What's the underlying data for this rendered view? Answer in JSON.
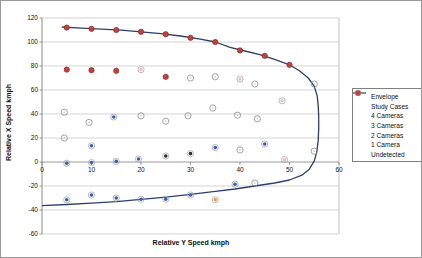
{
  "chart_data": {
    "type": "scatter",
    "title": "",
    "xlabel": "Relative Y Speed kmph",
    "ylabel": "Relative X Speed kmph",
    "xlim": [
      0,
      60
    ],
    "ylim": [
      -60,
      120
    ],
    "x_ticks": [
      0,
      10,
      20,
      30,
      40,
      50,
      60
    ],
    "y_ticks": [
      -60,
      -40,
      -20,
      0,
      20,
      40,
      60,
      80,
      100,
      120
    ],
    "grid": "horizontal",
    "legend_position": "right",
    "style": {
      "grid_color": "#c9c9c9",
      "axis_color": "#7f7f7f",
      "plot_border_color": "#b4b4b4",
      "text_color": "#111111",
      "background": "#ffffff",
      "halo_color": "#a8a8a8"
    },
    "envelope": {
      "name": "Envelope",
      "color": "#2c3f6e",
      "points": [
        [
          4,
          112.5
        ],
        [
          8,
          111.5
        ],
        [
          12,
          110.7
        ],
        [
          16,
          109.8
        ],
        [
          20,
          108.5
        ],
        [
          24,
          107
        ],
        [
          28,
          105
        ],
        [
          32,
          102.3
        ],
        [
          35,
          100
        ],
        [
          38,
          95.5
        ],
        [
          41,
          92.5
        ],
        [
          44,
          89.5
        ],
        [
          47,
          85.5
        ],
        [
          50,
          81
        ],
        [
          52,
          76
        ],
        [
          53.8,
          70
        ],
        [
          55,
          63
        ],
        [
          55.6,
          55
        ],
        [
          55.8,
          47
        ],
        [
          55.9,
          38
        ],
        [
          55.9,
          28
        ],
        [
          55.8,
          18
        ],
        [
          55.5,
          8
        ],
        [
          55,
          1
        ],
        [
          54,
          -6
        ],
        [
          52.5,
          -11
        ],
        [
          50,
          -15
        ],
        [
          47,
          -17.5
        ],
        [
          43,
          -20
        ],
        [
          39,
          -22.5
        ],
        [
          35,
          -24.5
        ],
        [
          30,
          -27
        ],
        [
          25,
          -29.3
        ],
        [
          20,
          -31.2
        ],
        [
          15,
          -33
        ],
        [
          10,
          -34.3
        ],
        [
          5,
          -35.4
        ],
        [
          0,
          -36.3
        ]
      ]
    },
    "series": [
      {
        "name": "Study Cases",
        "marker": "open",
        "color": "#8c8c8c",
        "dot_color": "#c2c2c2",
        "points": [
          [
            30,
            70
          ],
          [
            35,
            71
          ],
          [
            43,
            65
          ],
          [
            55,
            65
          ],
          [
            4.5,
            41.5
          ],
          [
            9.5,
            33
          ],
          [
            20,
            38.5
          ],
          [
            25,
            34
          ],
          [
            29.5,
            38.5
          ],
          [
            34.5,
            45
          ],
          [
            39.5,
            39
          ],
          [
            43.5,
            36
          ],
          [
            4.5,
            20
          ],
          [
            40,
            10
          ],
          [
            55,
            9
          ],
          [
            43,
            -17.5
          ]
        ]
      },
      {
        "name": "4 Cameras",
        "marker": "halo",
        "color": "#2d2d2d",
        "points": [
          [
            25,
            5
          ],
          [
            30,
            7
          ]
        ]
      },
      {
        "name": "3 Cameras",
        "marker": "halo",
        "color": "#3b5fae",
        "points": [
          [
            14.5,
            37.5
          ],
          [
            10,
            13.5
          ],
          [
            5,
            -1
          ],
          [
            10,
            -0.5
          ],
          [
            15,
            0.5
          ],
          [
            19.5,
            2.5
          ],
          [
            35,
            12
          ],
          [
            45,
            15
          ],
          [
            5,
            -31.5
          ],
          [
            10,
            -27.5
          ],
          [
            15,
            -30
          ],
          [
            20,
            -31
          ],
          [
            25,
            -31
          ],
          [
            30,
            -27.5
          ],
          [
            39,
            -18.5
          ]
        ]
      },
      {
        "name": "2 Cameras",
        "marker": "halo",
        "color": "#eec2c2",
        "points": [
          [
            20,
            77
          ],
          [
            40,
            69
          ],
          [
            48.5,
            51
          ],
          [
            49,
            2
          ]
        ]
      },
      {
        "name": "1 Camera",
        "marker": "halo",
        "color": "#e39a40",
        "points": [
          [
            35,
            -31.5
          ]
        ]
      },
      {
        "name": "Undetected",
        "marker": "solid",
        "color": "#c2423c",
        "edge_color": "#8f2f2b",
        "points": [
          [
            5,
            112
          ],
          [
            10,
            111
          ],
          [
            15,
            110
          ],
          [
            20,
            108.5
          ],
          [
            25,
            106.5
          ],
          [
            30,
            103.5
          ],
          [
            35,
            100
          ],
          [
            40,
            93
          ],
          [
            45,
            88.5
          ],
          [
            50,
            81
          ],
          [
            5,
            77
          ],
          [
            10,
            76.5
          ],
          [
            15,
            76
          ],
          [
            25,
            71
          ]
        ]
      }
    ]
  }
}
